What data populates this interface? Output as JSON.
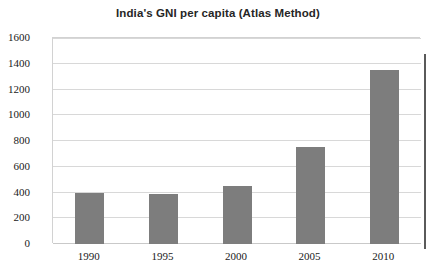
{
  "chart_data": {
    "type": "bar",
    "title": "India's GNI per capita (Atlas Method)",
    "xlabel": "",
    "ylabel": "",
    "categories": [
      "1990",
      "1995",
      "2000",
      "2005",
      "2010"
    ],
    "values": [
      400,
      390,
      450,
      750,
      1350
    ],
    "series": [
      {
        "name": "GNI per capita (Atlas Method)",
        "values": [
          400,
          390,
          450,
          750,
          1350
        ]
      }
    ],
    "ylim": [
      0,
      1600
    ],
    "ytick_step": 200,
    "yticks": [
      0,
      200,
      400,
      600,
      800,
      1000,
      1200,
      1400,
      1600
    ],
    "ytick_labels": [
      "0",
      "200",
      "400",
      "600",
      "800",
      "1000",
      "1200",
      "1400",
      "1600"
    ],
    "grid": true,
    "grid_axis": "y",
    "legend": false,
    "legend_position": "none",
    "bar_color": "#7d7d7d",
    "grid_color": "#d8d8d8",
    "axis_color": "#c9c9c9",
    "text_color": "#1a1a1a",
    "background_color": "#ffffff",
    "annotations": []
  }
}
